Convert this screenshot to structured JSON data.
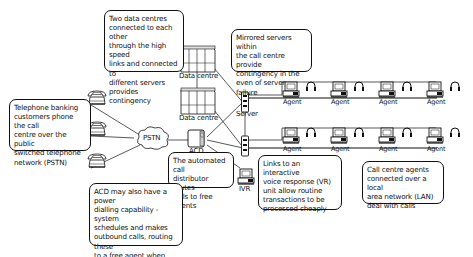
{
  "diagram": {
    "nodes": {
      "data_centre_1": "Data centre",
      "data_centre_2": "Data centre",
      "pstn": "PSTN",
      "acd": "ACD",
      "server": "Server",
      "ivr": "IVR",
      "agent": "Agent"
    },
    "agents_row1": [
      "Agent",
      "Agent",
      "Agent",
      "Agent"
    ],
    "agents_row2": [
      "Agent",
      "Agent",
      "Agent",
      "Agent"
    ],
    "callouts": {
      "data_centres": "Two data centres\nconnected to each other\nthrough the high speed\nlinks and connected to\ndifferent servers\nprovides contingency",
      "mirrored_servers": "Mirrored servers within\nthe call centre provide\ncontingency in the\neven of server failure",
      "telephone_banking": "Telephone banking\ncustomers phone the call\ncentre over the public\nswitched telephone\nnetwork (PSTN)",
      "acd_routes": "The automated call\ndistributor routes\ncalls to free agents",
      "power_dialling": "ACD may also have a power\ndialling capability - system\nschedules and makes\noutbound calls, routing these\nto a free agent when the call\nis answered",
      "ivr_links": "Links to an interactive\nvoice response (VR)\nunit allow routine\ntransactions to be\nprocessed cheaply",
      "lan_agents": "Call centre agents\nconnected over a local\narea network (LAN)\ndeal with calls"
    },
    "colors": {
      "stroke": "#111111",
      "fill": "#ffffff",
      "shade": "#d8d8d8"
    }
  }
}
